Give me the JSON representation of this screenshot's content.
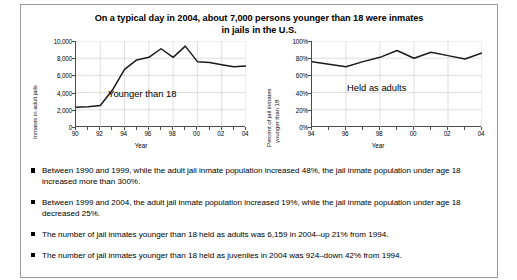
{
  "figure": {
    "title_line1": "On a typical day in 2004, about 7,000 persons younger than 18 were inmates",
    "title_line2": "in jails in the U.S."
  },
  "bullets": [
    "Between 1990 and 1999, while the adult jail inmate population increased 48%, the jail inmate population under age 18 increased more than 300%.",
    "Between 1999 and 2004, the adult jail inmate population increased 19%, while the jail inmate population under age 18 decreased 25%.",
    "The number of jail inmates younger than 18 held as adults was 6,159 in 2004–up 21% from 1994.",
    "The number of jail inmates younger than 18 held as juveniles in 2004 was 924–down 42% from 1994."
  ],
  "chart_data": [
    {
      "id": "inmates-in-adult-jails",
      "type": "line",
      "title": "",
      "xlabel": "Year",
      "ylabel": "Inmates in adult jails",
      "ylabel_lines": [
        "Inmates in adult jails"
      ],
      "series_annotation": "Younger than 18",
      "x": [
        1990,
        1991,
        1992,
        1993,
        1994,
        1995,
        1996,
        1997,
        1998,
        1999,
        2000,
        2001,
        2002,
        2003,
        2004
      ],
      "xtick_labels": [
        "90",
        "92",
        "94",
        "96",
        "98",
        "00",
        "02",
        "04"
      ],
      "xtick_values": [
        1990,
        1992,
        1994,
        1996,
        1998,
        2000,
        2002,
        2004
      ],
      "values": [
        2300,
        2350,
        2500,
        4300,
        6700,
        7800,
        8100,
        9100,
        8100,
        9400,
        7600,
        7500,
        7250,
        7000,
        7100
      ],
      "ytick_labels": [
        "0",
        "2,000",
        "4,000",
        "6,000",
        "8,000",
        "10,000"
      ],
      "ytick_values": [
        0,
        2000,
        4000,
        6000,
        8000,
        10000
      ],
      "ylim": [
        0,
        10000
      ],
      "xlim": [
        1990,
        2004
      ],
      "grid": true,
      "line_color": "#1a1a1a"
    },
    {
      "id": "percent-held-as-adults",
      "type": "line",
      "title": "",
      "xlabel": "Year",
      "ylabel": "Percent of jail inmates younger than 18",
      "ylabel_lines": [
        "Percent of jail inmates",
        "younger than 18"
      ],
      "series_annotation": "Held as adults",
      "x": [
        1994,
        1995,
        1996,
        1997,
        1998,
        1999,
        2000,
        2001,
        2002,
        2003,
        2004
      ],
      "xtick_labels": [
        "94",
        "96",
        "98",
        "00",
        "02",
        "04"
      ],
      "xtick_values": [
        1994,
        1996,
        1998,
        2000,
        2002,
        2004
      ],
      "values": [
        76,
        73,
        70,
        76,
        81,
        89,
        80,
        87,
        83,
        79,
        86
      ],
      "ytick_labels": [
        "0%",
        "20%",
        "40%",
        "60%",
        "80%",
        "100%"
      ],
      "ytick_values": [
        0,
        20,
        40,
        60,
        80,
        100
      ],
      "ylim": [
        0,
        100
      ],
      "xlim": [
        1994,
        2004
      ],
      "grid": true,
      "line_color": "#1a1a1a"
    }
  ]
}
